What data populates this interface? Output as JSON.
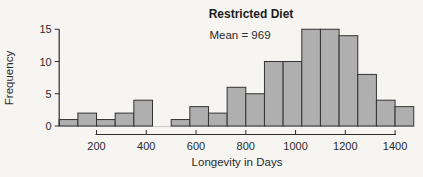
{
  "figure": {
    "width_px": 423,
    "height_px": 177
  },
  "chart_data": {
    "type": "bar",
    "subtype": "histogram",
    "title": "Restricted Diet",
    "annotation": "Mean = 969",
    "xlabel": "Longevity in Days",
    "ylabel": "Frequency",
    "bin_edges": [
      50,
      125,
      200,
      275,
      350,
      425,
      500,
      575,
      650,
      725,
      800,
      875,
      950,
      1025,
      1100,
      1175,
      1250,
      1325,
      1400,
      1475
    ],
    "frequencies": [
      1,
      2,
      1,
      2,
      4,
      0,
      1,
      3,
      2,
      6,
      5,
      10,
      10,
      15,
      15,
      14,
      8,
      4,
      3
    ],
    "total_count": 106,
    "x_ticks": [
      200,
      400,
      600,
      800,
      1000,
      1200,
      1400
    ],
    "y_ticks": [
      0,
      5,
      10,
      15
    ],
    "xlim": [
      50,
      1475
    ],
    "ylim": [
      0,
      15
    ],
    "grid": false,
    "legend": null,
    "colors": {
      "bar_fill": "#afafaf",
      "bar_stroke": "#333333",
      "axis": "#2e2e2e",
      "baseline": "#c8c8c6",
      "text": "#2a2a2a",
      "background": "#f6f5f2"
    }
  }
}
